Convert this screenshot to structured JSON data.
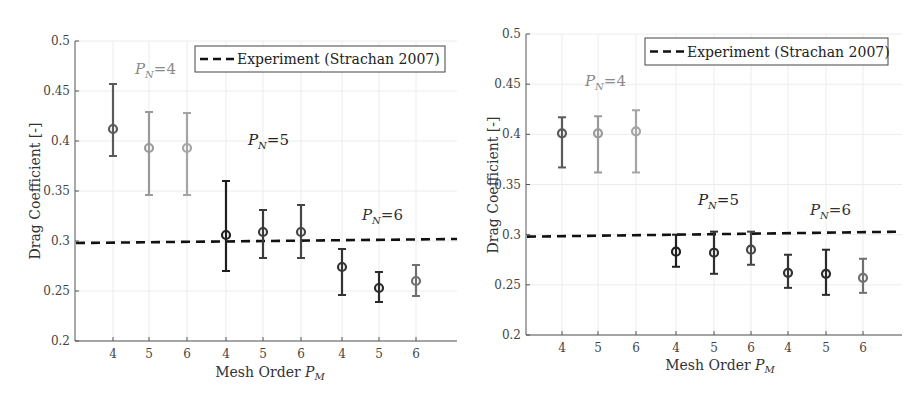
{
  "chart_data": [
    {
      "type": "scatter",
      "subtype": "errorbar",
      "title": "",
      "xlabel": "Mesh Order P_M",
      "ylabel": "Drag Coefficient [-]",
      "ylim": [
        0.2,
        0.5
      ],
      "yticks": [
        "0.2",
        "0.25",
        "0.3",
        "0.35",
        "0.4",
        "0.45",
        "0.5"
      ],
      "grid": true,
      "categories": [
        "4",
        "5",
        "6",
        "4",
        "5",
        "6",
        "4",
        "5",
        "6"
      ],
      "legend": {
        "position": "top-right",
        "entries": [
          "Experiment (Strachan 2007)"
        ]
      },
      "reference_line": {
        "name": "Experiment (Strachan 2007)",
        "style": "dashed",
        "y_start": 0.298,
        "y_end": 0.302
      },
      "annotations": [
        {
          "text": "P_N=4",
          "main": "P",
          "sub": "N",
          "rest": "=4",
          "color": "#8a8a8a"
        },
        {
          "text": "P_N=5",
          "main": "P",
          "sub": "N",
          "rest": "=5",
          "color": "#222222"
        },
        {
          "text": "P_N=6",
          "main": "P",
          "sub": "N",
          "rest": "=6",
          "color": "#333333"
        }
      ],
      "series": [
        {
          "name": "P_N=4",
          "mesh_order": [
            4,
            5,
            6
          ],
          "mean": [
            0.412,
            0.393,
            0.393
          ],
          "upper": [
            0.457,
            0.429,
            0.428
          ],
          "lower": [
            0.385,
            0.346,
            0.346
          ],
          "colors": [
            "#5a5a5a",
            "#9a9a9a",
            "#a5a5a5"
          ]
        },
        {
          "name": "P_N=5",
          "mesh_order": [
            4,
            5,
            6
          ],
          "mean": [
            0.306,
            0.309,
            0.309
          ],
          "upper": [
            0.36,
            0.331,
            0.336
          ],
          "lower": [
            0.27,
            0.283,
            0.283
          ],
          "colors": [
            "#1e1e1e",
            "#3a3a3a",
            "#454545"
          ]
        },
        {
          "name": "P_N=6",
          "mesh_order": [
            4,
            5,
            6
          ],
          "mean": [
            0.274,
            0.253,
            0.26
          ],
          "upper": [
            0.292,
            0.269,
            0.276
          ],
          "lower": [
            0.246,
            0.239,
            0.245
          ],
          "colors": [
            "#333333",
            "#2a2a2a",
            "#707070"
          ]
        }
      ]
    },
    {
      "type": "scatter",
      "subtype": "errorbar",
      "title": "",
      "xlabel": "Mesh Order P_M",
      "ylabel": "Drag Coefficient [-]",
      "ylim": [
        0.2,
        0.5
      ],
      "yticks": [
        "0.2",
        "0.25",
        "0.3",
        "0.35",
        "0.4",
        "0.45",
        "0.5"
      ],
      "grid": true,
      "categories": [
        "4",
        "5",
        "6",
        "4",
        "5",
        "6",
        "4",
        "5",
        "6"
      ],
      "legend": {
        "position": "top-right",
        "entries": [
          "Experiment (Strachan 2007)"
        ]
      },
      "reference_line": {
        "name": "Experiment (Strachan 2007)",
        "style": "dashed",
        "y_start": 0.298,
        "y_end": 0.303
      },
      "annotations": [
        {
          "text": "P_N=4",
          "main": "P",
          "sub": "N",
          "rest": "=4",
          "color": "#8a8a8a"
        },
        {
          "text": "P_N=5",
          "main": "P",
          "sub": "N",
          "rest": "=5",
          "color": "#222222"
        },
        {
          "text": "P_N=6",
          "main": "P",
          "sub": "N",
          "rest": "=6",
          "color": "#333333"
        }
      ],
      "series": [
        {
          "name": "P_N=4",
          "mesh_order": [
            4,
            5,
            6
          ],
          "mean": [
            0.401,
            0.401,
            0.403
          ],
          "upper": [
            0.417,
            0.418,
            0.424
          ],
          "lower": [
            0.367,
            0.362,
            0.362
          ],
          "colors": [
            "#5a5a5a",
            "#9a9a9a",
            "#a5a5a5"
          ]
        },
        {
          "name": "P_N=5",
          "mesh_order": [
            4,
            5,
            6
          ],
          "mean": [
            0.283,
            0.282,
            0.285
          ],
          "upper": [
            0.3,
            0.303,
            0.303
          ],
          "lower": [
            0.268,
            0.261,
            0.27
          ],
          "colors": [
            "#1e1e1e",
            "#2e2e2e",
            "#454545"
          ]
        },
        {
          "name": "P_N=6",
          "mesh_order": [
            4,
            5,
            6
          ],
          "mean": [
            0.262,
            0.261,
            0.257
          ],
          "upper": [
            0.28,
            0.285,
            0.276
          ],
          "lower": [
            0.247,
            0.24,
            0.242
          ],
          "colors": [
            "#333333",
            "#2a2a2a",
            "#707070"
          ]
        }
      ]
    }
  ],
  "layout": [
    {
      "left": 75,
      "right": 457,
      "top": 41,
      "bottom": 341,
      "xpos": [
        113,
        149,
        187,
        226,
        263,
        301,
        342,
        379,
        416
      ],
      "legend": {
        "x": 195,
        "y": 46,
        "w": 250,
        "h": 26
      },
      "ann_pos": [
        [
          135,
          74
        ],
        [
          248,
          145
        ],
        [
          362,
          220
        ]
      ],
      "ylabel_pos": [
        40,
        191
      ],
      "xlabel_pos": [
        270,
        377
      ]
    },
    {
      "left": 526,
      "right": 902,
      "top": 34,
      "bottom": 335,
      "xpos": [
        562,
        598,
        636,
        676,
        714,
        751,
        788,
        826,
        863
      ],
      "legend": {
        "x": 645,
        "y": 38,
        "w": 243,
        "h": 27
      },
      "ann_pos": [
        [
          585,
          86
        ],
        [
          698,
          205
        ],
        [
          810,
          215
        ]
      ],
      "ylabel_pos": [
        498,
        185
      ],
      "xlabel_pos": [
        720,
        370
      ]
    }
  ]
}
